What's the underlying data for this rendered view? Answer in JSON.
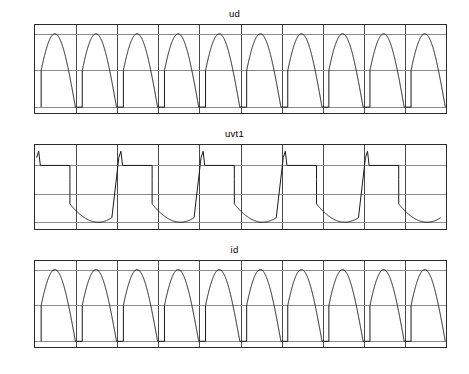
{
  "figure": {
    "background": "#ffffff",
    "axis_color": "#2b2b2b",
    "grid_color": "#8c8c8c",
    "curve_color": "#1a1a1a"
  },
  "chart_data": [
    {
      "type": "line",
      "name": "ud",
      "title": "ud",
      "xlabel": "",
      "ylabel": "",
      "xlim": [
        0,
        0.1
      ],
      "ylim": [
        -8,
        112
      ],
      "grid": true,
      "legend": "none",
      "xticks": [
        0,
        0.01,
        0.02,
        0.03,
        0.04,
        0.05,
        0.06,
        0.07,
        0.08,
        0.09,
        0.1
      ],
      "xticklabels": [
        "0",
        "0.01",
        "0.02",
        "0.03",
        "0.04",
        "0.05",
        "0.06",
        "0.07",
        "0.08",
        "0.09",
        "0.1"
      ],
      "yticks": [
        0,
        50,
        100
      ],
      "yticklabels": [
        "0",
        "50",
        "100"
      ],
      "description": "Rectified DC output voltage, firing-angle delayed half-sine pulses, 10 pulses over 0 to 0.1 s",
      "waveform": {
        "shape": "phase-controlled-rectified-sine",
        "period": 0.01,
        "pulses": 10,
        "first_fire_time": 0.0015,
        "peak": 100,
        "base": 0,
        "fire_level": 50,
        "fire_phase_deg": 30
      }
    },
    {
      "type": "line",
      "name": "uvt1",
      "title": "uvt1",
      "xlabel": "",
      "ylabel": "",
      "xlim": [
        0,
        0.1
      ],
      "ylim": [
        -112,
        36
      ],
      "grid": true,
      "legend": "none",
      "xticks": [
        0,
        0.01,
        0.02,
        0.03,
        0.04,
        0.05,
        0.06,
        0.07,
        0.08,
        0.09,
        0.1
      ],
      "xticklabels": [
        "0",
        "0.01",
        "0.02",
        "0.03",
        "0.04",
        "0.05",
        "0.06",
        "0.07",
        "0.08",
        "0.09",
        "0.1"
      ],
      "yticks": [
        0,
        -50,
        -100
      ],
      "yticklabels": [
        "0",
        "-50",
        "-100"
      ],
      "description": "Thyristor VT1 voltage: zero while conducting, negative sine dip while blocking, positive spike before firing",
      "waveform": {
        "shape": "thyristor-blocking-voltage",
        "period": 0.02,
        "cycles": 5,
        "positive_spike": 25,
        "negative_trough": -100,
        "zero_level": 0
      }
    },
    {
      "type": "line",
      "name": "id",
      "title": "id",
      "xlabel": "",
      "ylabel": "",
      "xlim": [
        0,
        0.1
      ],
      "ylim": [
        -0.8,
        11.2
      ],
      "grid": true,
      "legend": "none",
      "xticks": [
        0,
        0.01,
        0.02,
        0.03,
        0.04,
        0.05,
        0.06,
        0.07,
        0.08,
        0.09,
        0.1
      ],
      "xticklabels": [
        "0",
        "0.01",
        "0.02",
        "0.03",
        "0.04",
        "0.05",
        "0.06",
        "0.07",
        "0.08",
        "0.09",
        "0.1"
      ],
      "yticks": [
        0,
        5,
        10
      ],
      "yticklabels": [
        "0",
        "5",
        "10"
      ],
      "description": "Rectified DC load current, same pulse pattern as ud scaled to 10 A peak",
      "waveform": {
        "shape": "phase-controlled-rectified-sine",
        "period": 0.01,
        "pulses": 10,
        "first_fire_time": 0.0015,
        "peak": 10,
        "base": 0,
        "fire_level": 5,
        "fire_phase_deg": 30
      }
    }
  ]
}
